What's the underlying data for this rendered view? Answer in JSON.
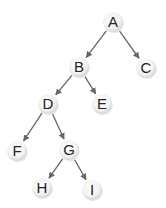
{
  "diagram": {
    "type": "binary-tree",
    "edge_color": "#666666",
    "node_fill_center": "#ffffff",
    "node_fill_edge": "#d8d8d8",
    "nodes": [
      {
        "id": "A",
        "label": "A",
        "x": 113,
        "y": 22
      },
      {
        "id": "B",
        "label": "B",
        "x": 79,
        "y": 67
      },
      {
        "id": "C",
        "label": "C",
        "x": 146,
        "y": 68
      },
      {
        "id": "D",
        "label": "D",
        "x": 48,
        "y": 104
      },
      {
        "id": "E",
        "label": "E",
        "x": 102,
        "y": 104
      },
      {
        "id": "F",
        "label": "F",
        "x": 17,
        "y": 151
      },
      {
        "id": "G",
        "label": "G",
        "x": 69,
        "y": 150
      },
      {
        "id": "H",
        "label": "H",
        "x": 42,
        "y": 188
      },
      {
        "id": "I",
        "label": "I",
        "x": 92,
        "y": 190
      }
    ],
    "edges": [
      {
        "from": "A",
        "to": "B"
      },
      {
        "from": "A",
        "to": "C"
      },
      {
        "from": "B",
        "to": "D"
      },
      {
        "from": "B",
        "to": "E"
      },
      {
        "from": "D",
        "to": "F"
      },
      {
        "from": "D",
        "to": "G"
      },
      {
        "from": "G",
        "to": "H"
      },
      {
        "from": "G",
        "to": "I"
      }
    ]
  }
}
